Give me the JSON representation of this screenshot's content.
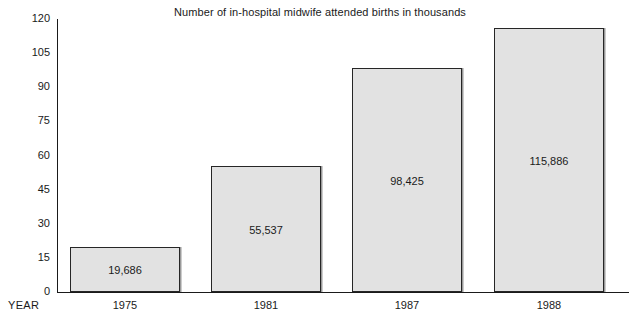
{
  "chart_data": {
    "type": "bar",
    "title": "Number of in-hospital midwife attended births in thousands",
    "xlabel": "YEAR",
    "ylabel": "",
    "categories": [
      "1975",
      "1981",
      "1987",
      "1988"
    ],
    "values": [
      19.686,
      55.537,
      98.425,
      115.886
    ],
    "data_labels": [
      "19,686",
      "55,537",
      "98,425",
      "115,886"
    ],
    "ylim": [
      0,
      120
    ],
    "yticks": [
      0,
      15,
      30,
      45,
      60,
      75,
      90,
      105,
      120
    ],
    "ytick_labels": [
      "0",
      "15",
      "30",
      "45",
      "60",
      "75",
      "90",
      "105",
      "120"
    ],
    "grid": false,
    "legend": "none",
    "bar_fill_color": "#e2e2e2",
    "bar_border_color": "#262626",
    "axis_color": "#1a1a1a",
    "background_color": "#ffffff"
  },
  "axis": {
    "year_caption": "YEAR"
  }
}
